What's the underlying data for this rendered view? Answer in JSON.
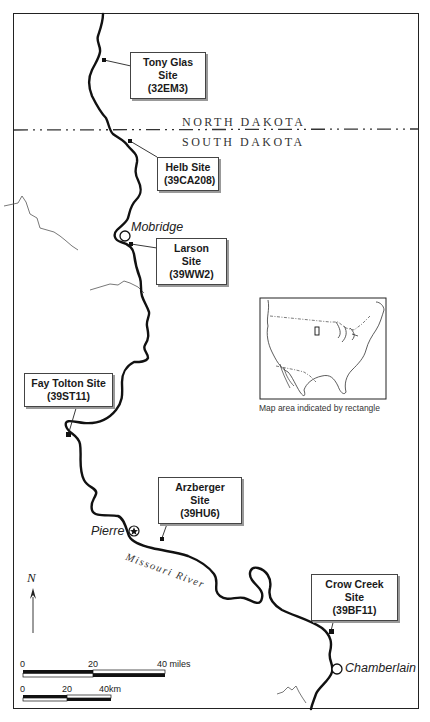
{
  "map": {
    "states": {
      "north": "NORTH DAKOTA",
      "south": "SOUTH DAKOTA"
    },
    "sites": [
      {
        "name": "Tony Glas Site",
        "code": "(32EM3)"
      },
      {
        "name": "Helb Site",
        "code": "(39CA208)"
      },
      {
        "name": "Larson Site",
        "code": "(39WW2)"
      },
      {
        "name": "Fay Tolton Site",
        "code": "(39ST11)"
      },
      {
        "name": "Arzberger Site",
        "code": "(39HU6)"
      },
      {
        "name": "Crow Creek Site",
        "code": "(39BF11)"
      }
    ],
    "cities": {
      "mobridge": "Mobridge",
      "pierre": "Pierre",
      "chamberlain": "Chamberlain"
    },
    "river_label": "Missouri River",
    "inset": {
      "caption": "Map area indicated by rectangle"
    },
    "north_arrow": "N",
    "scale_miles": {
      "ticks": [
        "0",
        "20",
        "40 miles"
      ]
    },
    "scale_km": {
      "ticks": [
        "0",
        "20",
        "40km"
      ]
    }
  }
}
